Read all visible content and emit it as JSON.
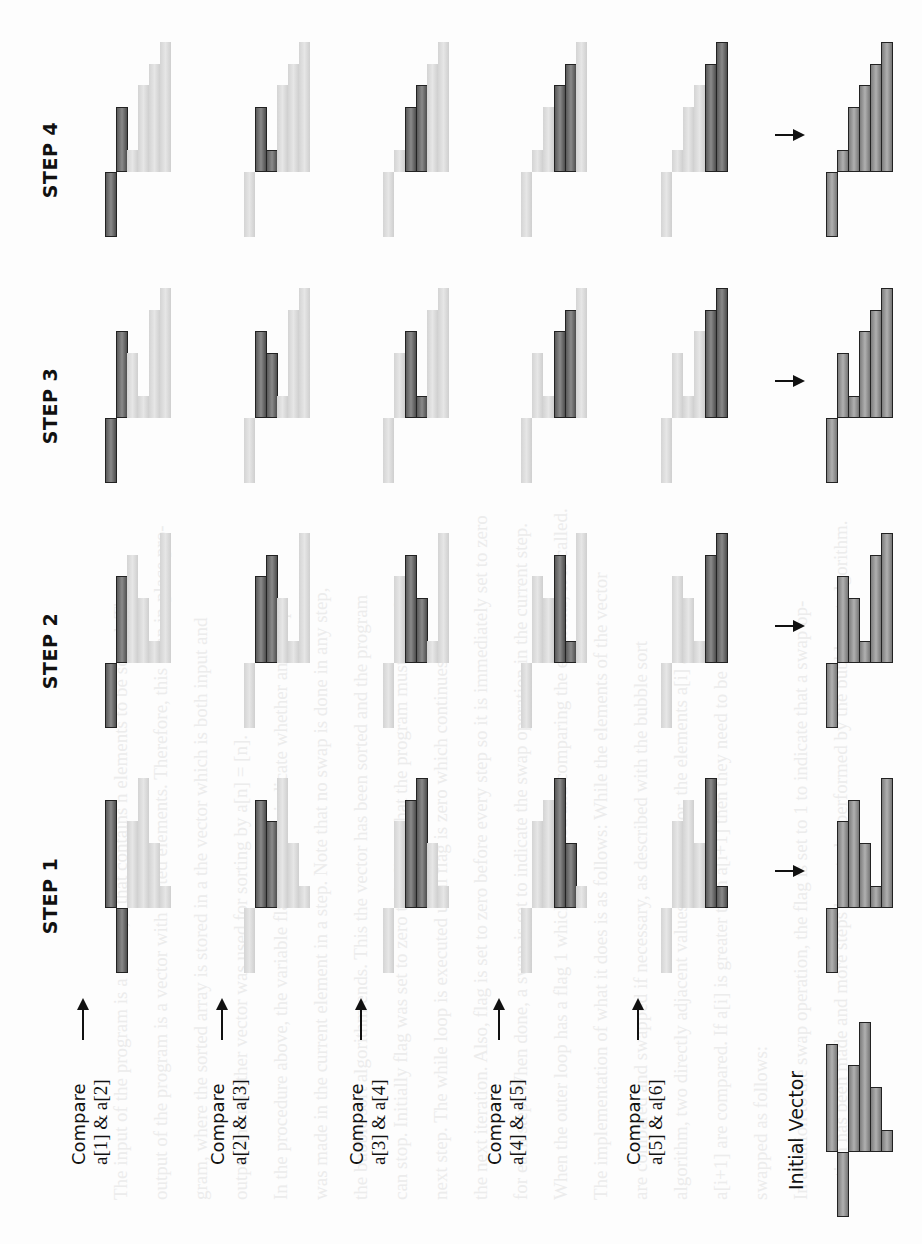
{
  "figure": {
    "step_labels": [
      "STEP 1",
      "STEP 2",
      "STEP 3",
      "STEP 4"
    ],
    "compare_labels": [
      {
        "word": "Compare",
        "expr": "a[1] & a[2]"
      },
      {
        "word": "Compare",
        "expr": "a[2] & a[3]"
      },
      {
        "word": "Compare",
        "expr": "a[3] & a[4]"
      },
      {
        "word": "Compare",
        "expr": "a[4] & a[5]"
      },
      {
        "word": "Compare",
        "expr": "a[5] & a[6]"
      }
    ],
    "initial_label": "Initial Vector",
    "colors": {
      "highlight": "#6e6e6e",
      "inactive": "#dddddd",
      "outline": "#222222",
      "arrow": "#111111"
    }
  },
  "background_text": [
    "The input of the program is a vector, a that contains n elements to be sorted. The",
    "output of the program is a vector with sorted elements. Therefore, this is an in-place pro-",
    "gram, where the sorted array is stored in a the vector which is both input and",
    "output and no other vector was used for sorting by a[n] = [n].",
    "In the procedure above, the variable flag is used to indicate whether any swap",
    "was made in the current element in a step. Note that no swap is done in any step,",
    "the bubble sort algorithm ends. This the vector has been sorted and the program",
    "can stop. Initially flag was set to zero to indicate that the program must go to the",
    "next step. The while loop is executed until flag is zero which continues",
    "the next iteration. Also, flag is set to zero before every step so it is immediately set to zero",
    "for each step. When done, a swap is set to indicate the swap operation in the current step.",
    "When the outer loop has a flag 1 which is updated and comparing the elements, it is called.",
    "The implementation of what it does is as follows: While the elements of the vector",
    "are compared and swapped if necessary, as described with the bubble sort",
    "algorithm, two directly adjacent values in the vector, the elements a[i] and",
    "a[i+1] are compared. If a[i] is greater than a[i+1] then they need to be",
    "swapped as follows:",
    "In addition to the swap operation, the flag is set to 1 to indicate that a swap op-",
    "eration has been made and more steps have to be performed by the bubble sort algorithm."
  ],
  "chart_data": {
    "type": "bar",
    "xlabel": "element index",
    "ylabel": "value",
    "categories": [
      "a[1]",
      "a[2]",
      "a[3]",
      "a[4]",
      "a[5]",
      "a[6]"
    ],
    "ylim": [
      -3,
      6
    ],
    "initial_vector": [
      5,
      -3,
      4,
      6,
      3,
      1
    ],
    "steps": [
      {
        "name": "STEP 1",
        "panels": [
          {
            "compare": [
              1,
              2
            ],
            "values": [
              5,
              -3,
              4,
              6,
              3,
              1
            ],
            "highlight": [
              1,
              2
            ]
          },
          {
            "compare": [
              2,
              3
            ],
            "values": [
              -3,
              5,
              4,
              6,
              3,
              1
            ],
            "highlight": [
              2,
              3
            ]
          },
          {
            "compare": [
              3,
              4
            ],
            "values": [
              -3,
              4,
              5,
              6,
              3,
              1
            ],
            "highlight": [
              3,
              4
            ]
          },
          {
            "compare": [
              4,
              5
            ],
            "values": [
              -3,
              4,
              5,
              6,
              3,
              1
            ],
            "highlight": [
              4,
              5
            ]
          },
          {
            "compare": [
              5,
              6
            ],
            "values": [
              -3,
              4,
              5,
              3,
              6,
              1
            ],
            "highlight": [
              5,
              6
            ]
          }
        ],
        "result": [
          -3,
          4,
          5,
          3,
          1,
          6
        ]
      },
      {
        "name": "STEP 2",
        "panels": [
          {
            "compare": [
              1,
              2
            ],
            "values": [
              -3,
              4,
              5,
              3,
              1,
              6
            ],
            "highlight": [
              1,
              2
            ]
          },
          {
            "compare": [
              2,
              3
            ],
            "values": [
              -3,
              4,
              5,
              3,
              1,
              6
            ],
            "highlight": [
              2,
              3
            ]
          },
          {
            "compare": [
              3,
              4
            ],
            "values": [
              -3,
              4,
              5,
              3,
              1,
              6
            ],
            "highlight": [
              3,
              4
            ]
          },
          {
            "compare": [
              4,
              5
            ],
            "values": [
              -3,
              4,
              3,
              5,
              1,
              6
            ],
            "highlight": [
              4,
              5
            ]
          },
          {
            "compare": [
              5,
              6
            ],
            "values": [
              -3,
              4,
              3,
              1,
              5,
              6
            ],
            "highlight": [
              5,
              6
            ]
          }
        ],
        "result": [
          -3,
          4,
          3,
          1,
          5,
          6
        ]
      },
      {
        "name": "STEP 3",
        "panels": [
          {
            "compare": [
              1,
              2
            ],
            "values": [
              -3,
              4,
              3,
              1,
              5,
              6
            ],
            "highlight": [
              1,
              2
            ]
          },
          {
            "compare": [
              2,
              3
            ],
            "values": [
              -3,
              4,
              3,
              1,
              5,
              6
            ],
            "highlight": [
              2,
              3
            ]
          },
          {
            "compare": [
              3,
              4
            ],
            "values": [
              -3,
              3,
              4,
              1,
              5,
              6
            ],
            "highlight": [
              3,
              4
            ]
          },
          {
            "compare": [
              4,
              5
            ],
            "values": [
              -3,
              3,
              1,
              4,
              5,
              6
            ],
            "highlight": [
              4,
              5
            ]
          },
          {
            "compare": [
              5,
              6
            ],
            "values": [
              -3,
              3,
              1,
              4,
              5,
              6
            ],
            "highlight": [
              5,
              6
            ]
          }
        ],
        "result": [
          -3,
          3,
          1,
          4,
          5,
          6
        ]
      },
      {
        "name": "STEP 4",
        "panels": [
          {
            "compare": [
              1,
              2
            ],
            "values": [
              -3,
              3,
              1,
              4,
              5,
              6
            ],
            "highlight": [
              1,
              2
            ]
          },
          {
            "compare": [
              2,
              3
            ],
            "values": [
              -3,
              3,
              1,
              4,
              5,
              6
            ],
            "highlight": [
              2,
              3
            ]
          },
          {
            "compare": [
              3,
              4
            ],
            "values": [
              -3,
              1,
              3,
              4,
              5,
              6
            ],
            "highlight": [
              3,
              4
            ]
          },
          {
            "compare": [
              4,
              5
            ],
            "values": [
              -3,
              1,
              3,
              4,
              5,
              6
            ],
            "highlight": [
              4,
              5
            ]
          },
          {
            "compare": [
              5,
              6
            ],
            "values": [
              -3,
              1,
              3,
              4,
              5,
              6
            ],
            "highlight": [
              5,
              6
            ]
          }
        ],
        "result": [
          -3,
          1,
          3,
          4,
          5,
          6
        ]
      }
    ]
  }
}
